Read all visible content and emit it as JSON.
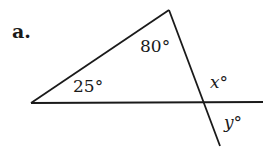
{
  "problem": {
    "part_label": "a.",
    "angles": {
      "top": "80°",
      "left": "25°",
      "x": "x°",
      "y": "y°"
    },
    "colors": {
      "ink": "#1a1a1a",
      "background": "#ffffff"
    }
  }
}
